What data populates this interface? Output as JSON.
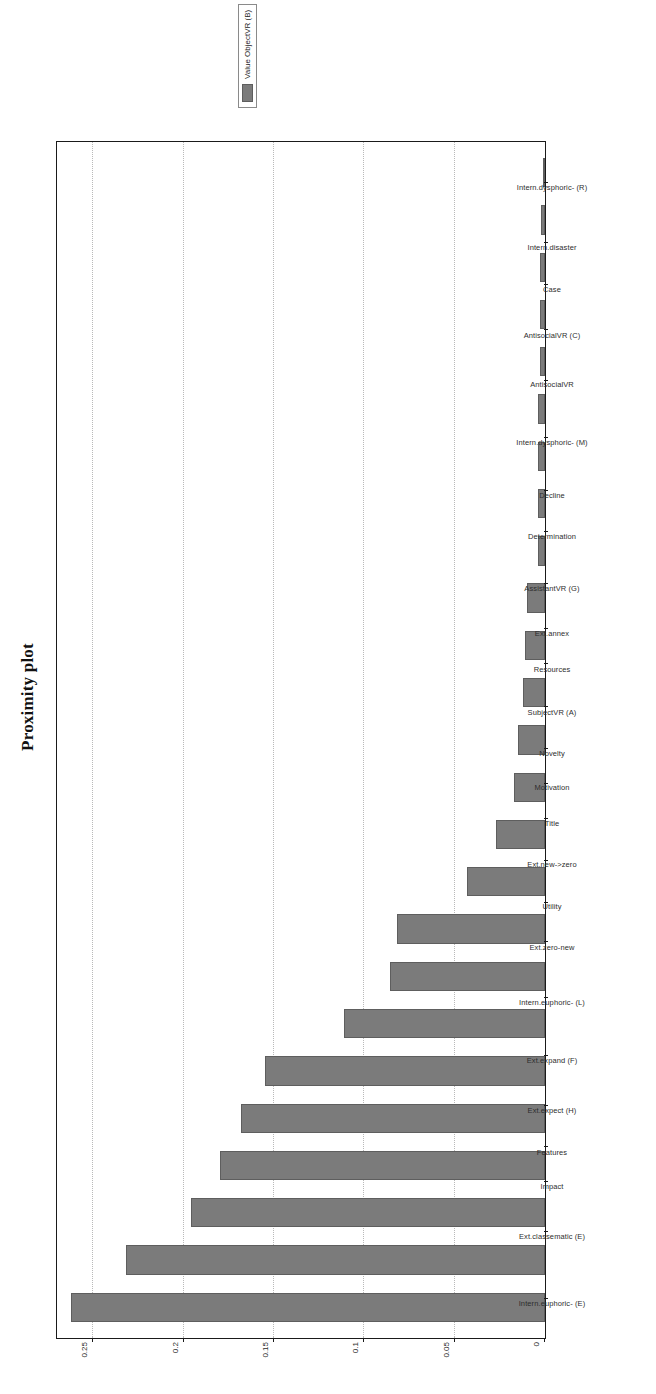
{
  "chart_data": {
    "type": "bar",
    "title": "Proximity plot",
    "orientation": "vertical-bars-rotated",
    "xlabel": "",
    "ylabel": "",
    "ylim": [
      0,
      0.27
    ],
    "grid": true,
    "yticks": [
      "0",
      "0.05",
      "0.1",
      "0.15",
      "0.2",
      "0.25"
    ],
    "ytick_values": [
      0,
      0.05,
      0.1,
      0.15,
      0.2,
      0.25
    ],
    "legend_position": "right",
    "legend": [
      {
        "name": "Value ObjectVR (B)",
        "color": "#7b7b7b"
      }
    ],
    "categories": [
      "Intern.euphoric- (E)",
      "Ext.classematic (E)",
      "Impact",
      "Features",
      "Ext.expect (H)",
      "Ext.expand (F)",
      "Intern.euphoric- (L)",
      "Ext.zero-new",
      "Utility",
      "Ext.new->zero",
      "Title",
      "Motivation",
      "Novelty",
      "SubjectVR (A)",
      "Resources",
      "Ext.annex",
      "AssistantVR (G)",
      "Determination",
      "Decline",
      "Intern.dysphoric- (M)",
      "AntisocialVR",
      "AntisocialVR (C)",
      "Case",
      "Intern.disaster",
      "Intern.dysphoric- (R)"
    ],
    "values": [
      0.262,
      0.232,
      0.196,
      0.18,
      0.168,
      0.155,
      0.111,
      0.086,
      0.082,
      0.043,
      0.027,
      0.017,
      0.015,
      0.012,
      0.011,
      0.01,
      0.004,
      0.004,
      0.004,
      0.004,
      0.003,
      0.003,
      0.003,
      0.002,
      0.001
    ],
    "series": [
      {
        "name": "Value ObjectVR (B)",
        "color": "#7b7b7b",
        "values": [
          0.262,
          0.232,
          0.196,
          0.18,
          0.168,
          0.155,
          0.111,
          0.086,
          0.082,
          0.043,
          0.027,
          0.017,
          0.015,
          0.012,
          0.011,
          0.01,
          0.004,
          0.004,
          0.004,
          0.004,
          0.003,
          0.003,
          0.003,
          0.002,
          0.001
        ]
      }
    ]
  }
}
